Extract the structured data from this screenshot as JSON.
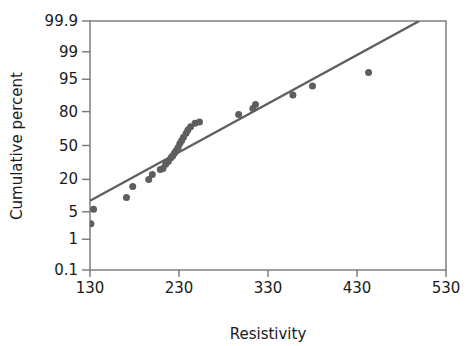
{
  "chart_data": {
    "type": "scatter",
    "title": "",
    "subtitle": "",
    "xlabel": "Resistivity",
    "ylabel": "Cumulative percent",
    "grid": false,
    "legend": null,
    "x_scale": "linear",
    "y_scale": "normal-probability",
    "xlim": [
      130,
      530
    ],
    "ylim": [
      0.1,
      99.9
    ],
    "xticks": [
      130,
      230,
      330,
      430,
      530
    ],
    "xtick_labels": [
      "130",
      "230",
      "330",
      "430",
      "530"
    ],
    "yticks": [
      0.1,
      1,
      5,
      20,
      50,
      80,
      95,
      99,
      99.9
    ],
    "ytick_labels": [
      "0.1",
      "1",
      "5",
      "20",
      "50",
      "80",
      "95",
      "99",
      "99.9"
    ],
    "marker_color": "#5e5e5e",
    "line_color": "#5e5e5e",
    "axis_color": "#777777",
    "text_color": "#1a1a1a",
    "marker_size": 7,
    "series": [
      {
        "name": "Resistivity data",
        "type": "scatter",
        "points": [
          {
            "x": 131,
            "y": 2.6
          },
          {
            "x": 134,
            "y": 5.7
          },
          {
            "x": 171,
            "y": 9.8
          },
          {
            "x": 178,
            "y": 15.5
          },
          {
            "x": 196,
            "y": 20.0
          },
          {
            "x": 200,
            "y": 23.5
          },
          {
            "x": 209,
            "y": 27.5
          },
          {
            "x": 212,
            "y": 28.5
          },
          {
            "x": 215,
            "y": 32.0
          },
          {
            "x": 218,
            "y": 34.5
          },
          {
            "x": 221,
            "y": 38.0
          },
          {
            "x": 223,
            "y": 40.0
          },
          {
            "x": 225,
            "y": 42.5
          },
          {
            "x": 227,
            "y": 45.0
          },
          {
            "x": 229,
            "y": 48.0
          },
          {
            "x": 231,
            "y": 52.0
          },
          {
            "x": 233,
            "y": 55.0
          },
          {
            "x": 235,
            "y": 58.0
          },
          {
            "x": 238,
            "y": 62.0
          },
          {
            "x": 240,
            "y": 65.0
          },
          {
            "x": 243,
            "y": 68.0
          },
          {
            "x": 248,
            "y": 71.0
          },
          {
            "x": 253,
            "y": 72.0
          },
          {
            "x": 297,
            "y": 78.0
          },
          {
            "x": 313,
            "y": 82.0
          },
          {
            "x": 316,
            "y": 84.5
          },
          {
            "x": 358,
            "y": 89.5
          },
          {
            "x": 380,
            "y": 93.0
          },
          {
            "x": 443,
            "y": 96.5
          }
        ]
      },
      {
        "name": "Fitted normal line",
        "type": "line",
        "endpoints": [
          {
            "x": 130,
            "y": 8.5
          },
          {
            "x": 500,
            "y": 99.9
          }
        ]
      }
    ]
  },
  "axes": {
    "x_title": "Resistivity",
    "y_title": "Cumulative percent"
  }
}
